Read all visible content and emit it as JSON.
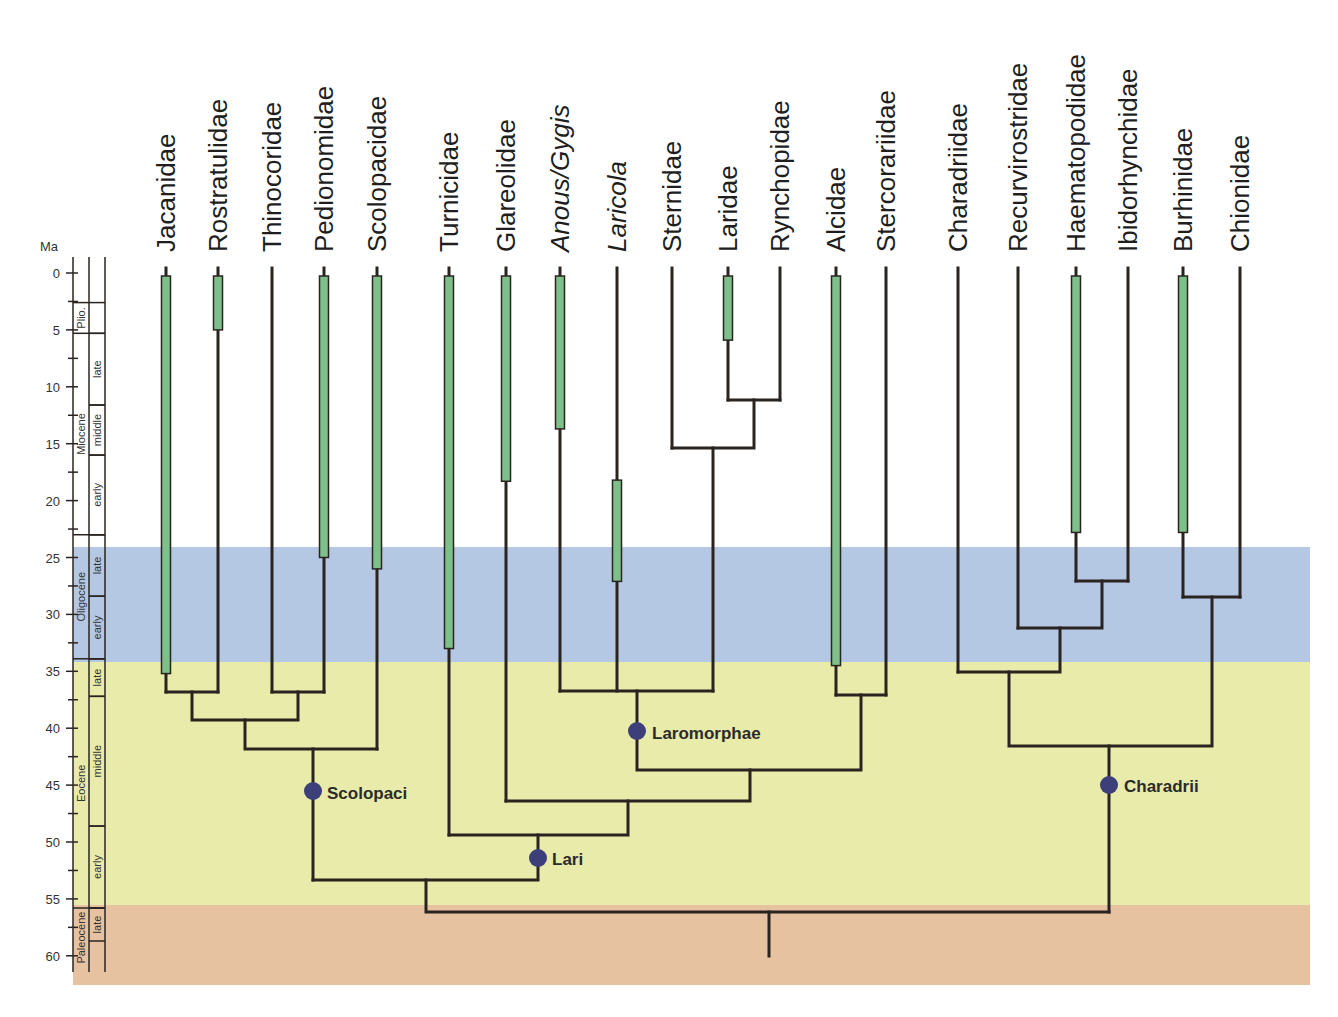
{
  "figure": {
    "axis_unit": "Ma",
    "ticks": [
      0,
      5,
      10,
      15,
      20,
      25,
      30,
      35,
      40,
      45,
      50,
      55,
      60
    ],
    "epochs": [
      {
        "name": "Plio.",
        "start": 2.6,
        "end": 5.3
      },
      {
        "name": "Miocene",
        "start": 5.3,
        "end": 23.0
      },
      {
        "name": "Oligocene",
        "start": 23.0,
        "end": 33.9
      },
      {
        "name": "Eocene",
        "start": 33.9,
        "end": 55.8
      },
      {
        "name": "Paleocene",
        "start": 55.8,
        "end": 62.0
      }
    ],
    "subepochs": [
      {
        "name": "late",
        "start": 5.3,
        "end": 11.6
      },
      {
        "name": "middle",
        "start": 11.6,
        "end": 16.0
      },
      {
        "name": "early",
        "start": 16.0,
        "end": 23.0
      },
      {
        "name": "late",
        "start": 23.0,
        "end": 28.4
      },
      {
        "name": "early",
        "start": 28.4,
        "end": 33.9
      },
      {
        "name": "late",
        "start": 33.9,
        "end": 37.2
      },
      {
        "name": "middle",
        "start": 37.2,
        "end": 48.6
      },
      {
        "name": "early",
        "start": 48.6,
        "end": 55.8
      },
      {
        "name": "late",
        "start": 55.8,
        "end": 58.7
      }
    ],
    "background_bands": [
      {
        "period": "Oligocene",
        "start": 23.8,
        "end": 33.9,
        "color": "#b4c8e4"
      },
      {
        "period": "Eocene",
        "start": 33.9,
        "end": 55.3,
        "color": "#e8ebaa"
      },
      {
        "period": "Paleocene",
        "start": 55.3,
        "end": 62.0,
        "color": "#e6c2a0"
      }
    ],
    "colors": {
      "branch": "#2a2420",
      "fossil_bar": "#7fbf8a",
      "node_dot": "#3d3f7a"
    },
    "taxa": [
      {
        "name": "Jacanidae",
        "italic": false,
        "fossil": [
          0,
          35.2
        ]
      },
      {
        "name": "Rostratulidae",
        "italic": false,
        "fossil": [
          0,
          5
        ]
      },
      {
        "name": "Thinocoridae",
        "italic": false,
        "fossil": null
      },
      {
        "name": "Pedionomidae",
        "italic": false,
        "fossil": [
          0,
          25
        ]
      },
      {
        "name": "Scolopacidae",
        "italic": false,
        "fossil": [
          0,
          26
        ]
      },
      {
        "name": "Turnicidae",
        "italic": false,
        "fossil": [
          0,
          33
        ]
      },
      {
        "name": "Glareolidae",
        "italic": false,
        "fossil": [
          0,
          18.3
        ]
      },
      {
        "name": "Anous/Gygis",
        "italic": true,
        "fossil": [
          0,
          13.7
        ]
      },
      {
        "name": "Laricola",
        "italic": true,
        "fossil": [
          18.2,
          27.1
        ]
      },
      {
        "name": "Sternidae",
        "italic": false,
        "fossil": null
      },
      {
        "name": "Laridae",
        "italic": false,
        "fossil": [
          0,
          5.9
        ]
      },
      {
        "name": "Rynchopidae",
        "italic": false,
        "fossil": null
      },
      {
        "name": "Alcidae",
        "italic": false,
        "fossil": [
          0,
          34.5
        ]
      },
      {
        "name": "Stercorariidae",
        "italic": false,
        "fossil": null
      },
      {
        "name": "Charadriidae",
        "italic": false,
        "fossil": null
      },
      {
        "name": "Recurvirostridae",
        "italic": false,
        "fossil": null
      },
      {
        "name": "Haematopodidae",
        "italic": false,
        "fossil": [
          0,
          22.8
        ]
      },
      {
        "name": "Ibidorhynchidae",
        "italic": false,
        "fossil": null
      },
      {
        "name": "Burhinidae",
        "italic": false,
        "fossil": [
          0,
          22.8
        ]
      },
      {
        "name": "Chionidae",
        "italic": false,
        "fossil": null
      }
    ],
    "clade_labels": [
      {
        "name": "Scolopaci",
        "age": 45.5
      },
      {
        "name": "Lari",
        "age": 51.3
      },
      {
        "name": "Laromorphae",
        "age": 40.3
      },
      {
        "name": "Charadrii",
        "age": 45.0
      }
    ]
  }
}
